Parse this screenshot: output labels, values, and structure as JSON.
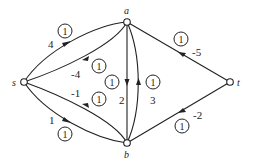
{
  "graph": {
    "nodes": [
      {
        "id": "s",
        "label": "s"
      },
      {
        "id": "a",
        "label": "a"
      },
      {
        "id": "b",
        "label": "b"
      },
      {
        "id": "t",
        "label": "t"
      }
    ],
    "edges": [
      {
        "id": "s-a",
        "from": "s",
        "to": "a",
        "cost": "4",
        "capacity": "1"
      },
      {
        "id": "a-s",
        "from": "a",
        "to": "s",
        "cost": "-4",
        "capacity": "1"
      },
      {
        "id": "b-s",
        "from": "b",
        "to": "s",
        "cost": "-1",
        "capacity": "1"
      },
      {
        "id": "s-b",
        "from": "s",
        "to": "b",
        "cost": "1",
        "capacity": "1"
      },
      {
        "id": "a-b",
        "from": "a",
        "to": "b",
        "cost": "2",
        "capacity": "1"
      },
      {
        "id": "b-a",
        "from": "b",
        "to": "a",
        "cost": "3",
        "capacity": "1"
      },
      {
        "id": "t-a",
        "from": "t",
        "to": "a",
        "cost": "-5",
        "capacity": "1"
      },
      {
        "id": "t-b",
        "from": "t",
        "to": "b",
        "cost": "-2",
        "capacity": "1"
      }
    ]
  }
}
